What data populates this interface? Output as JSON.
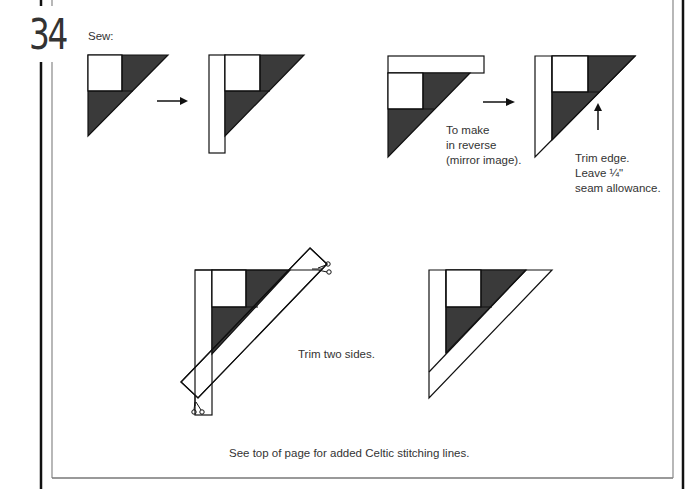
{
  "page": {
    "number": "34",
    "step_label": "Sew:",
    "reverse_note": [
      "To make",
      "in reverse",
      "(mirror image)."
    ],
    "trim_note": [
      "Trim edge.",
      "Leave ¼\"",
      "seam allowance."
    ],
    "trim_two_sides": "Trim two sides.",
    "footer_note": "See top of page for added Celtic stitching lines."
  },
  "colors": {
    "fabric_dark": "#3a3a3a",
    "fabric_light": "#ffffff",
    "outline": "#111111",
    "frame_gray": "#777777",
    "text": "#333333"
  },
  "icons": [
    "arrow-right-icon",
    "arrow-right-icon",
    "arrow-up-icon",
    "scissors-icon",
    "scissors-icon"
  ]
}
